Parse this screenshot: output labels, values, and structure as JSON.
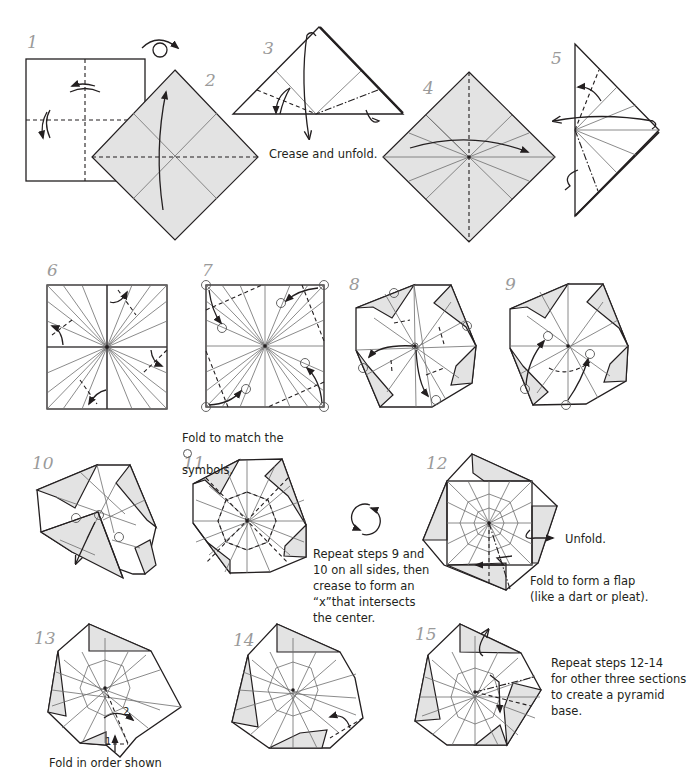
{
  "diagram": {
    "colors": {
      "paper_colored": "#e3e3e3",
      "paper_white": "#ffffff",
      "line": "#231f20",
      "crease": "#6d6d6d",
      "step_number": "#9a9a9a"
    },
    "steps": [
      {
        "number": "1",
        "icons": [
          "valley-fold-arrow",
          "turn-over-icon"
        ]
      },
      {
        "number": "2",
        "icons": [
          "valley-fold-arrow"
        ]
      },
      {
        "number": "3",
        "caption": "Crease and unfold.",
        "icons": [
          "valley-fold-arrow",
          "mountain-fold-arrow"
        ]
      },
      {
        "number": "4",
        "icons": [
          "valley-fold-arrow"
        ]
      },
      {
        "number": "5",
        "icons": [
          "valley-fold-arrow",
          "mountain-fold-arrow"
        ]
      },
      {
        "number": "6",
        "icons": [
          "valley-fold-arrow"
        ]
      },
      {
        "number": "7",
        "caption_before": "Fold to match the",
        "caption_after": "symbols.",
        "icons": [
          "reference-circle-icon"
        ]
      },
      {
        "number": "8",
        "icons": [
          "reference-circle-icon",
          "valley-fold-arrow"
        ]
      },
      {
        "number": "9",
        "icons": [
          "reference-circle-icon",
          "valley-fold-arrow"
        ]
      },
      {
        "number": "10",
        "icons": [
          "reference-circle-icon",
          "valley-fold-arrow"
        ]
      },
      {
        "number": "11",
        "caption": "Repeat steps 9 and\n10 on all sides, then\ncrease to form an\n“x”that intersects\nthe center.",
        "icons": [
          "rotate-icon"
        ]
      },
      {
        "number": "12",
        "caption_unfold": "Unfold.",
        "caption": "Fold to form a flap\n(like a dart or pleat).",
        "icons": [
          "unfold-arrow",
          "pleat-arrow"
        ]
      },
      {
        "number": "13",
        "caption": "Fold in order shown",
        "fold_order": [
          "1",
          "2"
        ]
      },
      {
        "number": "14",
        "icons": [
          "valley-fold-arrow"
        ]
      },
      {
        "number": "15",
        "caption": "Repeat steps 12-14\nfor other three sections\nto create a pyramid\nbase.",
        "icons": [
          "mountain-fold-arrow",
          "pleat-arrow"
        ]
      }
    ]
  }
}
